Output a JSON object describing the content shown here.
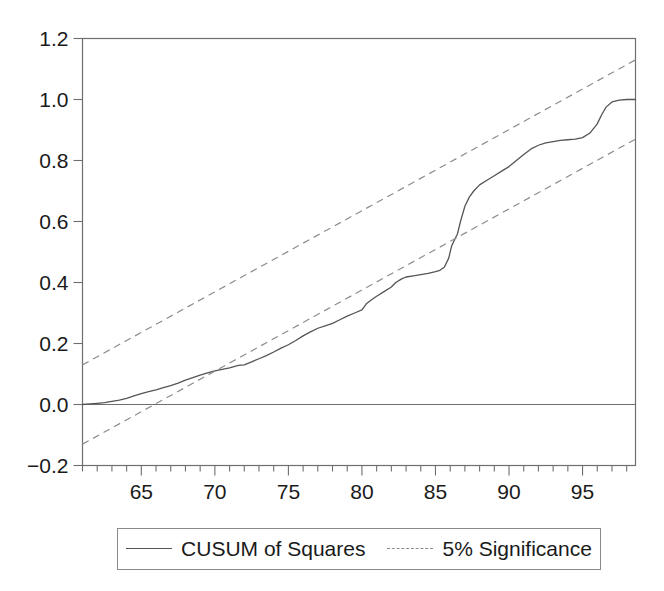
{
  "chart_data": {
    "type": "line",
    "title": "",
    "xlabel": "",
    "ylabel": "",
    "xlim": [
      61.0,
      98.6
    ],
    "ylim": [
      -0.2,
      1.2
    ],
    "grid": false,
    "legend_position": "bottom",
    "y_ticks": [
      "1.2",
      "1.0",
      "0.8",
      "0.6",
      "0.4",
      "0.2",
      "0.0",
      "-0.2"
    ],
    "y_tick_values": [
      1.2,
      1.0,
      0.8,
      0.6,
      0.4,
      0.2,
      0.0,
      -0.2
    ],
    "x_ticks": [
      "65",
      "70",
      "75",
      "80",
      "85",
      "90",
      "95"
    ],
    "x_tick_values": [
      65,
      70,
      75,
      80,
      85,
      90,
      95
    ],
    "x_minor_tick_step": 1,
    "zero_line": 0.0,
    "series": [
      {
        "name": "CUSUM of Squares",
        "style": "solid",
        "color": "#555555",
        "x": [
          61.0,
          61.5,
          62.0,
          62.5,
          63.0,
          63.5,
          64.0,
          64.5,
          65.0,
          65.5,
          66.0,
          66.5,
          67.0,
          67.5,
          68.0,
          68.5,
          69.0,
          69.5,
          70.0,
          70.5,
          71.0,
          71.3,
          71.6,
          72.0,
          72.5,
          73.0,
          73.5,
          74.0,
          74.5,
          75.0,
          75.5,
          76.0,
          76.5,
          77.0,
          77.5,
          78.0,
          78.5,
          79.0,
          79.5,
          80.0,
          80.3,
          80.7,
          81.0,
          81.5,
          82.0,
          82.3,
          82.7,
          83.0,
          83.5,
          84.0,
          84.5,
          85.0,
          85.3,
          85.6,
          85.9,
          86.1,
          86.3,
          86.5,
          86.7,
          87.0,
          87.3,
          87.6,
          88.0,
          88.5,
          89.0,
          89.5,
          90.0,
          90.5,
          91.0,
          91.5,
          92.0,
          92.5,
          93.0,
          93.5,
          94.0,
          94.5,
          95.0,
          95.5,
          96.0,
          96.3,
          96.6,
          97.0,
          97.5,
          98.0,
          98.6
        ],
        "y": [
          0.0,
          0.002,
          0.004,
          0.006,
          0.01,
          0.014,
          0.02,
          0.028,
          0.036,
          0.042,
          0.048,
          0.055,
          0.062,
          0.07,
          0.08,
          0.088,
          0.096,
          0.104,
          0.11,
          0.115,
          0.12,
          0.124,
          0.128,
          0.13,
          0.14,
          0.15,
          0.16,
          0.172,
          0.185,
          0.196,
          0.21,
          0.225,
          0.238,
          0.25,
          0.258,
          0.266,
          0.278,
          0.29,
          0.3,
          0.31,
          0.33,
          0.345,
          0.355,
          0.37,
          0.385,
          0.4,
          0.412,
          0.418,
          0.422,
          0.426,
          0.43,
          0.436,
          0.44,
          0.45,
          0.48,
          0.52,
          0.54,
          0.56,
          0.6,
          0.65,
          0.68,
          0.7,
          0.72,
          0.735,
          0.75,
          0.765,
          0.78,
          0.8,
          0.82,
          0.838,
          0.85,
          0.858,
          0.862,
          0.866,
          0.868,
          0.87,
          0.875,
          0.89,
          0.92,
          0.95,
          0.975,
          0.992,
          0.998,
          1.0,
          1.0
        ]
      },
      {
        "name": "5% Significance",
        "style": "dashed",
        "color": "#8c8c8c",
        "bound": "upper",
        "x": [
          61.0,
          98.6
        ],
        "y": [
          0.13,
          1.13
        ]
      },
      {
        "name": "5% Significance",
        "style": "dashed",
        "color": "#8c8c8c",
        "bound": "lower",
        "x": [
          61.0,
          98.6
        ],
        "y": [
          -0.13,
          0.87
        ]
      }
    ],
    "legend": [
      {
        "label": "CUSUM of Squares",
        "style": "solid",
        "color": "#555555"
      },
      {
        "label": "5% Significance",
        "style": "dashed",
        "color": "#8c8c8c"
      }
    ]
  },
  "axes": {
    "frame_color": "#6e6e6e",
    "text_color": "#1a1a1a"
  }
}
